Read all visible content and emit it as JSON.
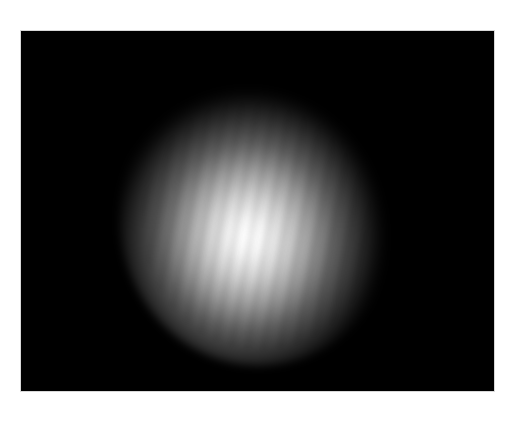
{
  "image": {
    "description": "Grayscale photograph of a diffuse, roughly circular bright light spot on a black background",
    "background_color": "#000000",
    "spot_center_color": "#ffffff",
    "page_background": "#ffffff"
  }
}
